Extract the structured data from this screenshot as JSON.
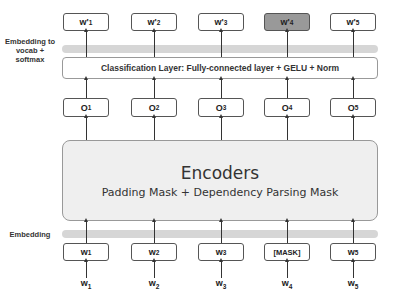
{
  "diagram": {
    "side_labels": {
      "top": "Embedding to vocab + softmax",
      "bottom": "Embedding"
    },
    "outputs": [
      {
        "base": "w'",
        "sub": "1",
        "highlight": false
      },
      {
        "base": "w'",
        "sub": "2",
        "highlight": false
      },
      {
        "base": "w'",
        "sub": "3",
        "highlight": false
      },
      {
        "base": "w'",
        "sub": "4",
        "highlight": true
      },
      {
        "base": "w'",
        "sub": "5",
        "highlight": false
      }
    ],
    "classification_layer": "Classification Layer: Fully-connected layer + GELU + Norm",
    "hidden": [
      {
        "base": "O",
        "sub": "1"
      },
      {
        "base": "O",
        "sub": "2"
      },
      {
        "base": "O",
        "sub": "3"
      },
      {
        "base": "O",
        "sub": "4"
      },
      {
        "base": "O",
        "sub": "5"
      }
    ],
    "encoder": {
      "title": "Encoders",
      "subtitle": "Padding Mask + Dependency Parsing Mask"
    },
    "input_boxes": [
      {
        "base": "w",
        "sub": "1"
      },
      {
        "base": "w",
        "sub": "2"
      },
      {
        "base": "w",
        "sub": "3"
      },
      {
        "base": "[MASK]",
        "sub": ""
      },
      {
        "base": "w",
        "sub": "5"
      }
    ],
    "inputs": [
      {
        "base": "w",
        "sub": "1"
      },
      {
        "base": "w",
        "sub": "2"
      },
      {
        "base": "w",
        "sub": "3"
      },
      {
        "base": "w",
        "sub": "4"
      },
      {
        "base": "w",
        "sub": "5"
      }
    ],
    "colors": {
      "highlight_box": "#999999",
      "band": "#d6d6d6",
      "encoder_fill": "#efefef",
      "border": "#555555"
    }
  }
}
